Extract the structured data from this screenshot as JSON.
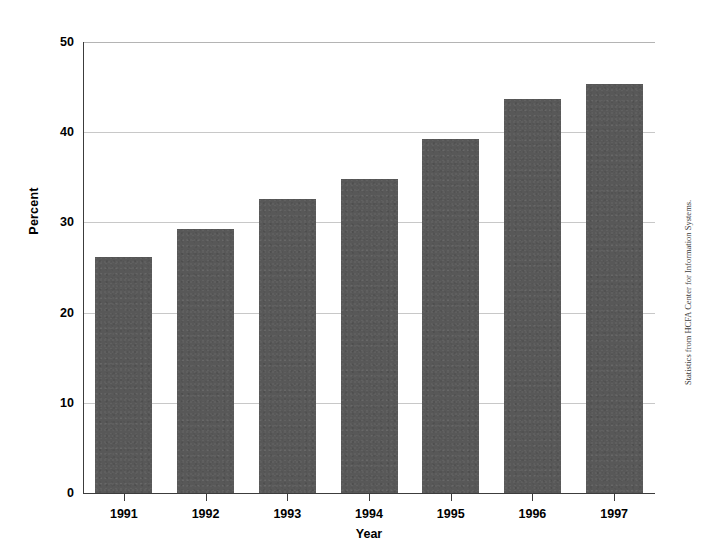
{
  "chart_data": {
    "type": "bar",
    "title": "",
    "subtitle": "",
    "categories": [
      "1991",
      "1992",
      "1993",
      "1994",
      "1995",
      "1996",
      "1997"
    ],
    "values": [
      26.2,
      29.3,
      32.6,
      34.8,
      39.3,
      43.7,
      45.3
    ],
    "series": [
      {
        "name": "Percent",
        "values": [
          26.2,
          29.3,
          32.6,
          34.8,
          39.3,
          43.7,
          45.3
        ]
      }
    ],
    "xlabel": "Year",
    "ylabel": "Percent",
    "ylim": [
      0,
      50
    ],
    "yticks": [
      0,
      10,
      20,
      30,
      40,
      50
    ],
    "ytick_labels": [
      "0",
      "10",
      "20",
      "30",
      "40",
      "50"
    ],
    "grid": true,
    "grid_axis": "y",
    "legend": false,
    "legend_position": "none",
    "bar_color": "#585858",
    "gridline_color": "#c8c8c8",
    "axis_color": "#3c3c3c",
    "annotations": [
      {
        "name": "source-note",
        "text": "Statistics from HCFA Center for Information Systems.",
        "position": "right-margin",
        "rotation": -90
      }
    ]
  },
  "axes": {
    "y_title": "Percent",
    "x_title": "Year"
  },
  "source": {
    "note": "Statistics from HCFA Center for Information Systems."
  }
}
